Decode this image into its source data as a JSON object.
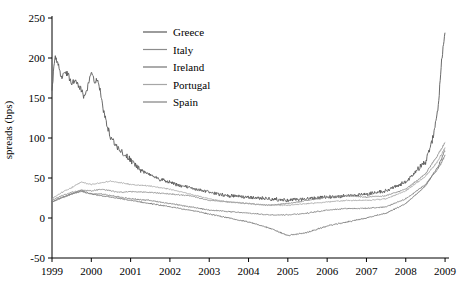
{
  "chart_data": {
    "type": "line",
    "title": "",
    "xlabel": "",
    "ylabel": "spreads (bps)",
    "ylim": [
      -50,
      250
    ],
    "xlim": [
      1999,
      2009.1
    ],
    "ytick_labels": [
      "-50",
      "0",
      "50",
      "100",
      "150",
      "200",
      "250"
    ],
    "ytick_values": [
      -50,
      0,
      50,
      100,
      150,
      200,
      250
    ],
    "xtick_labels": [
      "1999",
      "2000",
      "2001",
      "2002",
      "2003",
      "2004",
      "2005",
      "2006",
      "2007",
      "2008",
      "2009"
    ],
    "xtick_values": [
      1999,
      2000,
      2001,
      2002,
      2003,
      2004,
      2005,
      2006,
      2007,
      2008,
      2009
    ],
    "grid": false,
    "legend_position": "top-center",
    "series": [
      {
        "name": "Greece",
        "color": "#595959",
        "x": [
          1999.0,
          1999.08,
          1999.17,
          1999.25,
          1999.33,
          1999.42,
          1999.5,
          1999.58,
          1999.67,
          1999.75,
          1999.83,
          1999.92,
          2000.0,
          2000.08,
          2000.17,
          2000.25,
          2000.33,
          2000.42,
          2000.5,
          2000.58,
          2000.67,
          2000.75,
          2000.83,
          2000.92,
          2001.0,
          2001.17,
          2001.33,
          2001.5,
          2001.67,
          2001.83,
          2002.0,
          2002.25,
          2002.5,
          2002.75,
          2003.0,
          2003.5,
          2004.0,
          2004.5,
          2005.0,
          2005.5,
          2006.0,
          2006.5,
          2007.0,
          2007.5,
          2008.0,
          2008.25,
          2008.5,
          2008.67,
          2008.83,
          2008.92,
          2009.0
        ],
        "y": [
          160,
          205,
          190,
          175,
          185,
          178,
          168,
          172,
          166,
          160,
          150,
          165,
          182,
          170,
          175,
          150,
          130,
          112,
          100,
          95,
          88,
          84,
          80,
          76,
          72,
          64,
          58,
          54,
          50,
          47,
          45,
          40,
          38,
          35,
          32,
          28,
          26,
          24,
          22,
          24,
          26,
          28,
          30,
          34,
          45,
          58,
          70,
          95,
          140,
          200,
          232
        ]
      },
      {
        "name": "Italy",
        "color": "#8c8c8c",
        "x": [
          1999.0,
          1999.25,
          1999.5,
          1999.75,
          2000.0,
          2000.25,
          2000.5,
          2000.75,
          2001.0,
          2001.5,
          2002.0,
          2002.5,
          2003.0,
          2003.5,
          2004.0,
          2004.5,
          2005.0,
          2005.5,
          2006.0,
          2006.5,
          2007.0,
          2007.5,
          2008.0,
          2008.5,
          2008.83,
          2009.0
        ],
        "y": [
          22,
          28,
          32,
          35,
          34,
          36,
          34,
          32,
          33,
          32,
          30,
          28,
          22,
          20,
          18,
          16,
          18,
          22,
          26,
          28,
          26,
          28,
          36,
          55,
          80,
          95
        ]
      },
      {
        "name": "Ireland",
        "color": "#737373",
        "x": [
          1999.0,
          1999.25,
          1999.5,
          1999.75,
          2000.0,
          2000.25,
          2000.5,
          2000.75,
          2001.0,
          2001.5,
          2002.0,
          2002.5,
          2003.0,
          2003.5,
          2004.0,
          2004.5,
          2005.0,
          2005.5,
          2006.0,
          2006.5,
          2007.0,
          2007.5,
          2008.0,
          2008.5,
          2008.83,
          2009.0
        ],
        "y": [
          20,
          26,
          30,
          34,
          30,
          28,
          26,
          24,
          22,
          18,
          14,
          10,
          5,
          0,
          -5,
          -12,
          -22,
          -18,
          -10,
          -5,
          0,
          6,
          18,
          40,
          65,
          85
        ]
      },
      {
        "name": "Portugal",
        "color": "#a6a6a6",
        "x": [
          1999.0,
          1999.25,
          1999.5,
          1999.75,
          2000.0,
          2000.25,
          2000.5,
          2000.75,
          2001.0,
          2001.5,
          2002.0,
          2002.5,
          2003.0,
          2003.5,
          2004.0,
          2004.5,
          2005.0,
          2005.5,
          2006.0,
          2006.5,
          2007.0,
          2007.5,
          2008.0,
          2008.5,
          2008.83,
          2009.0
        ],
        "y": [
          24,
          32,
          38,
          45,
          42,
          44,
          46,
          44,
          42,
          40,
          36,
          30,
          24,
          20,
          18,
          16,
          16,
          18,
          20,
          22,
          22,
          24,
          34,
          52,
          72,
          88
        ]
      },
      {
        "name": "Spain",
        "color": "#808080",
        "x": [
          1999.0,
          1999.25,
          1999.5,
          1999.75,
          2000.0,
          2000.25,
          2000.5,
          2000.75,
          2001.0,
          2001.5,
          2002.0,
          2002.5,
          2003.0,
          2003.5,
          2004.0,
          2004.5,
          2005.0,
          2005.5,
          2006.0,
          2006.5,
          2007.0,
          2007.5,
          2008.0,
          2008.5,
          2008.83,
          2009.0
        ],
        "y": [
          20,
          25,
          30,
          33,
          30,
          30,
          28,
          26,
          24,
          22,
          18,
          14,
          10,
          8,
          6,
          4,
          4,
          6,
          10,
          12,
          12,
          14,
          24,
          42,
          62,
          78
        ]
      }
    ],
    "legend": [
      {
        "label": "Greece",
        "color": "#595959"
      },
      {
        "label": "Italy",
        "color": "#8c8c8c"
      },
      {
        "label": "Ireland",
        "color": "#737373"
      },
      {
        "label": "Portugal",
        "color": "#a6a6a6"
      },
      {
        "label": "Spain",
        "color": "#808080"
      }
    ]
  }
}
